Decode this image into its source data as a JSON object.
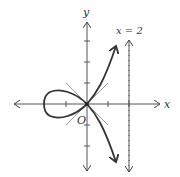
{
  "diagram": {
    "type": "strophoid-plot",
    "labels": {
      "y_axis": "y",
      "x_axis": "x",
      "origin": "O",
      "asymptote": "x = 2"
    },
    "colors": {
      "ink": "#333333",
      "light": "#888888"
    }
  }
}
